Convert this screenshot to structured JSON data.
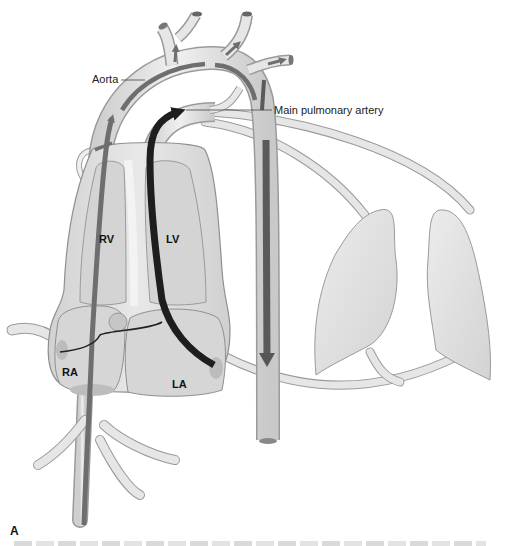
{
  "figure": {
    "panel_letter": "A",
    "labels": {
      "aorta": "Aorta",
      "main_pulmonary_artery": "Main pulmonary artery",
      "right_ventricle": "RV",
      "left_ventricle": "LV",
      "right_atrium": "RA",
      "left_atrium": "LA"
    },
    "caption": ""
  },
  "colors": {
    "background": "#ffffff",
    "vessel_fill": "#e4e4e4",
    "vessel_outline": "#9a9a9a",
    "chamber_fill": "#d6d6d6",
    "chamber_outline": "#8f8f8f",
    "heart_outer_fill": "#e2e2e2",
    "lung_fill": "#dedede",
    "flow_arrow_mid": "#6e6e6e",
    "flow_arrow_dark": "#1e1e1e",
    "label_text": "#222222"
  },
  "flows": [
    {
      "name": "venous-return-path",
      "description": "Gray flow rising from below through RA and RV into main pulmonary artery/aorta",
      "color": "#6e6e6e"
    },
    {
      "name": "left-heart-path",
      "description": "Black flow from LA up through LV into the aortic arch",
      "color": "#1e1e1e"
    },
    {
      "name": "descending-aorta-flow",
      "description": "Gray arrow running down the descending aorta",
      "color": "#5a5a5a"
    }
  ]
}
